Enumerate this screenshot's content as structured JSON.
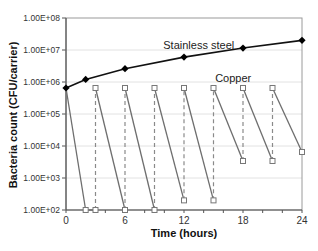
{
  "chart_data": {
    "type": "line",
    "title": "",
    "xlabel": "Time (hours)",
    "ylabel": "Bacteria count (CFU/carrier)",
    "xlim": [
      0,
      24
    ],
    "ylim": [
      100,
      100000000
    ],
    "yscale": "log",
    "grid": true,
    "legend": "inline labels",
    "x_ticks": [
      0,
      6,
      12,
      18,
      24
    ],
    "x_tick_labels": [
      "0",
      "6",
      "12",
      "18",
      "24"
    ],
    "y_ticks": [
      100,
      1000,
      10000,
      100000,
      1000000,
      10000000,
      100000000
    ],
    "y_tick_labels": [
      "1.00E+02",
      "1.00E+03",
      "1.00E+04",
      "1.00E+05",
      "1.00E+06",
      "1.00E+07",
      "1.00E+08"
    ],
    "series": [
      {
        "name": "Stainless steel",
        "marker": "diamond-filled",
        "line": "solid-black",
        "x": [
          0,
          2,
          6,
          12,
          18,
          24
        ],
        "values": [
          650000,
          1200000,
          2600000,
          6000000,
          11500000,
          20000000
        ]
      },
      {
        "name": "Copper",
        "marker": "square-open",
        "line": "solid-gray decay, dashed-gray re-inoculation",
        "x": [
          0,
          2,
          3,
          3,
          6,
          6,
          9,
          9,
          12,
          12,
          15,
          15,
          18,
          18,
          21,
          21,
          24
        ],
        "values": [
          650000,
          100,
          100,
          650000,
          100,
          650000,
          100,
          650000,
          200,
          650000,
          200,
          650000,
          3400,
          650000,
          3400,
          650000,
          6500
        ],
        "reinoculation_times": [
          3,
          6,
          9,
          12,
          15,
          18,
          21
        ]
      }
    ],
    "annotations": [
      {
        "text": "Stainless steel",
        "x": 13.5,
        "y": 14000000
      },
      {
        "text": "Copper",
        "x": 17,
        "y": 1300000
      }
    ]
  }
}
